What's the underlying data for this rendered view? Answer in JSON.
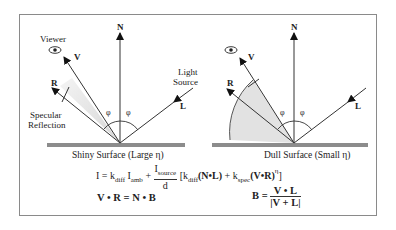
{
  "figure": {
    "left_panel": {
      "caption": "Shiny Surface (Large η)",
      "labels": {
        "normal": "N",
        "viewer_vector": "V",
        "reflection_vector": "R",
        "light_vector": "L",
        "viewer": "Viewer",
        "light_source_line1": "Light",
        "light_source_line2": "Source",
        "specular_line1": "Specular",
        "specular_line2": "Reflection",
        "angle_left": "φ",
        "angle_right": "φ"
      }
    },
    "right_panel": {
      "caption": "Dull Surface (Small η)",
      "labels": {
        "normal": "N",
        "viewer_vector": "V",
        "reflection_vector": "R",
        "light_vector": "L",
        "angle_left": "φ",
        "angle_right": "φ"
      }
    },
    "equations": {
      "phong": {
        "lhs": "I = k",
        "kdiff_sub": "diff",
        "I_amb": " I",
        "amb_sub": "amb",
        "plus": " + ",
        "frac_num": "I",
        "frac_num_sub": "source",
        "frac_den": "d",
        "bracket_open": " [k",
        "kdiff2_sub": "diff",
        "NdotL": "(N•L)",
        "plus2": " + k",
        "kspec_sub": "spec",
        "VdotR": "(V•R)",
        "eta_sup": "η",
        "bracket_close": "]"
      },
      "halfway_identity": {
        "V": "V",
        "dot1": " • ",
        "R": "R",
        "eq": " = ",
        "N": "N",
        "dot2": " • ",
        "B": "B"
      },
      "halfway_def": {
        "B": "B",
        "eq": " = ",
        "num": "V • L",
        "den": "|V + L|"
      }
    },
    "colors": {
      "frame": "#8a8a8a",
      "surface": "#8c8c8c",
      "lobe": "#e2e2e2",
      "ink": "#222222"
    }
  }
}
